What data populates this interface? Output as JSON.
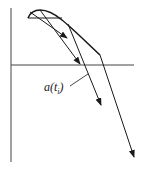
{
  "diagram": {
    "type": "vector-diagram",
    "axes": {
      "vertical": {
        "x": 11,
        "y1": 8,
        "y2": 162
      },
      "horizontal": {
        "y": 65,
        "x1": 11,
        "x2": 134
      }
    },
    "curve": {
      "path": "M28,18 C32,8 45,6 62,20 C72,28 84,40 100,55"
    },
    "chord": {
      "x1": 28,
      "y1": 18,
      "x2": 62,
      "y2": 18
    },
    "vectors": [
      {
        "name": "vector-1",
        "x1": 30,
        "y1": 12,
        "x2": 67,
        "y2": 38
      },
      {
        "name": "vector-2",
        "x1": 40,
        "y1": 10,
        "x2": 80,
        "y2": 64
      },
      {
        "name": "vector-3",
        "x1": 68,
        "y1": 24,
        "x2": 101,
        "y2": 105
      },
      {
        "name": "vector-4",
        "x1": 100,
        "y1": 55,
        "x2": 134,
        "y2": 157
      }
    ],
    "label": {
      "prefix": "a(t",
      "subscript": "i",
      "suffix": ")",
      "leader": {
        "x1": 70,
        "y1": 86,
        "x2": 88,
        "y2": 74
      }
    },
    "colors": {
      "stroke": "#1a1a1a",
      "background": "#ffffff"
    }
  }
}
